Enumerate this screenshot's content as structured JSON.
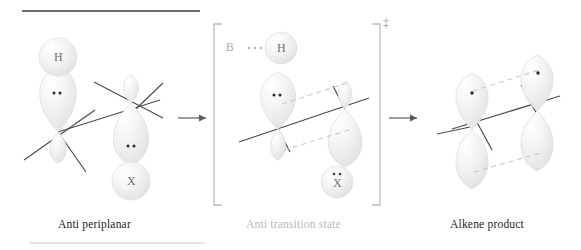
{
  "figure": {
    "title_rule_top": "horizontal-rule",
    "title_rule_bottom": "horizontal-rule"
  },
  "panels": [
    {
      "id": "anti-periplanar",
      "caption": "Anti periplanar",
      "caption_color": "#1d1d1d",
      "atoms": [
        {
          "symbol": "H",
          "lone_pairs": 0
        },
        {
          "symbol": "X",
          "lone_pairs": 0
        }
      ],
      "orbital_dots": [
        {
          "label": "lone-pair",
          "count": 2
        },
        {
          "label": "lone-pair",
          "count": 2
        }
      ]
    },
    {
      "id": "anti-transition-state",
      "caption": "Anti transition state",
      "caption_color": "#b9b9b9",
      "bracket": "square-brackets",
      "superscript": "‡",
      "base_label": "B",
      "base_dots": "···",
      "atoms": [
        {
          "symbol": "H",
          "lone_pairs": 0
        },
        {
          "symbol": "X",
          "lone_pairs": 2
        }
      ],
      "orbital_dots": [
        {
          "label": "lone-pair",
          "count": 2
        }
      ]
    },
    {
      "id": "alkene-product",
      "caption": "Alkene product",
      "caption_color": "#1d1d1d",
      "atoms": [],
      "orbital_dots": [
        {
          "label": "single-electron",
          "count": 1
        },
        {
          "label": "single-electron",
          "count": 1
        }
      ]
    }
  ],
  "arrows": [
    {
      "id": "arrow-1",
      "direction": "right"
    },
    {
      "id": "arrow-2",
      "direction": "right"
    }
  ],
  "colors": {
    "bond": "#4c4c4c",
    "orbital_light": "#fbfbfb",
    "orbital_mid": "#ededed",
    "orbital_edge": "#d8d8d8",
    "dashed": "#c9c9c9",
    "rule_dark": "#6d6d6d",
    "rule_light": "#d9d9d9",
    "bracket": "#bdbdbd",
    "text_gray": "#b9b9b9",
    "text_dark": "#1d1d1d"
  }
}
